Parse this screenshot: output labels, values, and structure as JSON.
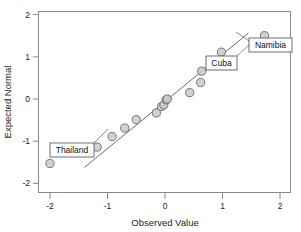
{
  "chart_data": {
    "type": "scatter",
    "title": "",
    "subtitle": "",
    "xlabel": "Observed Value",
    "ylabel": "Expected Normal",
    "xlim": [
      -2.35,
      2.25
    ],
    "ylim": [
      -2.3,
      2.2
    ],
    "grid": false,
    "legend": null,
    "x_ticks": [
      "-2",
      "-1",
      "0",
      "1",
      "2"
    ],
    "x_tick_values": [
      -2,
      -1,
      0,
      1,
      2
    ],
    "y_ticks": [
      "2",
      "1",
      "0",
      "-1",
      "-2"
    ],
    "y_tick_values": [
      2,
      1,
      0,
      -1,
      -2
    ],
    "series": [
      {
        "name": "Normal Q-Q points",
        "marker": "circle",
        "x": [
          -2.0,
          -1.18,
          -0.92,
          -0.7,
          -0.5,
          -0.15,
          -0.06,
          -0.02,
          0.02,
          0.04,
          0.43,
          0.62,
          0.64,
          0.98,
          1.73
        ],
        "y": [
          -1.53,
          -1.14,
          -0.89,
          -0.69,
          -0.49,
          -0.33,
          -0.18,
          -0.14,
          -0.02,
          0.0,
          0.15,
          0.39,
          0.66,
          1.11,
          1.5
        ]
      }
    ],
    "reference_line": {
      "name": "normal reference line",
      "x": [
        -1.4,
        1.45
      ],
      "y": [
        -1.62,
        1.56
      ]
    },
    "annotations": [
      {
        "label": "Thailand",
        "point_x": -2.0,
        "point_y": -1.53,
        "box_x": 50,
        "box_y": 143,
        "box_w": 44,
        "box_h": 14,
        "leader_x1": 94,
        "leader_y1": 143,
        "leader_x2": 108,
        "leader_y2": 129
      },
      {
        "label": "Cuba",
        "point_x": 0.64,
        "point_y": 0.66,
        "box_x": 206,
        "box_y": 56,
        "box_w": 31,
        "box_h": 14,
        "leader_x1": 237,
        "leader_y1": 56,
        "leader_x2": 250,
        "leader_y2": 44
      },
      {
        "label": "Namibia",
        "point_x": 1.73,
        "point_y": 1.5,
        "box_x": 249,
        "box_y": 38,
        "box_w": 43,
        "box_h": 14,
        "leader_x1": 249,
        "leader_y1": 41,
        "leader_x2": 236,
        "leader_y2": 32
      }
    ]
  },
  "geometry": {
    "plot_left": 38,
    "plot_right": 291,
    "plot_top": 11,
    "plot_bottom": 193,
    "x_pixel_at_zero": 165,
    "y_pixel_at_zero": 99,
    "px_per_x_unit": 57.5,
    "px_per_y_unit": 42.2,
    "marker_radius": 4.1
  },
  "colors": {
    "frame": "#8a8a8a",
    "marker_fill": "#c9c9c9",
    "marker_stroke": "#6a6a6a",
    "reference_line": "#5a5a5a",
    "text": "#1a1a1a",
    "callout_border": "#4a4a4a",
    "background": "#ffffff"
  }
}
